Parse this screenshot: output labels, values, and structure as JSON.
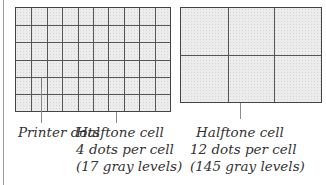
{
  "figure": {
    "left_panel": {
      "name": "4-dot halftone grid",
      "columns": 10,
      "rows": 6,
      "labels": {
        "printer_dots": "Printer dots",
        "cell_title": "Halftone cell",
        "cell_dots": "4 dots per cell",
        "cell_levels": "(17 gray levels)"
      }
    },
    "right_panel": {
      "name": "12-dot halftone grid",
      "columns": 3,
      "rows": 2,
      "labels": {
        "cell_title": "Halftone cell",
        "cell_dots": "12 dots per cell",
        "cell_levels": "(145 gray levels)"
      }
    },
    "colors": {
      "grid_line": "#555555",
      "fill": "#ececec",
      "text": "#333333"
    }
  }
}
